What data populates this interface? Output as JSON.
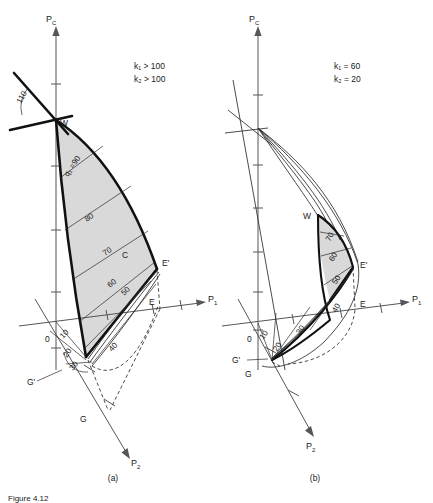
{
  "figure": {
    "caption_partial": "Figure 4.12",
    "panels": [
      {
        "id": "a",
        "panel_label": "(a)",
        "conditions": [
          "k₁ > 100",
          "k₂ > 100"
        ],
        "axes": {
          "vertical": "P",
          "vertical_sub": "C",
          "horizontal": "P",
          "horizontal_sub": "1",
          "depth": "P",
          "depth_sub": "2"
        },
        "origin_label": "0",
        "points": [
          {
            "name": "W",
            "label": "W"
          },
          {
            "name": "E-prime",
            "label": "E'"
          },
          {
            "name": "E",
            "label": "E"
          },
          {
            "name": "G-prime",
            "label": "G'"
          },
          {
            "name": "G",
            "label": "G"
          },
          {
            "name": "C",
            "label": "C"
          }
        ],
        "angle_label": "110",
        "contours": [
          "q₁ =90",
          "80",
          "70",
          "60",
          "50",
          "40",
          "30",
          "20",
          "10"
        ]
      },
      {
        "id": "b",
        "panel_label": "(b)",
        "conditions": [
          "k₁ = 60",
          "k₂ = 20"
        ],
        "axes": {
          "vertical": "P",
          "vertical_sub": "C",
          "horizontal": "P",
          "horizontal_sub": "1",
          "depth": "P",
          "depth_sub": "2"
        },
        "origin_label": "0",
        "points": [
          {
            "name": "W",
            "label": "W"
          },
          {
            "name": "E-prime",
            "label": "E'"
          },
          {
            "name": "E",
            "label": "E"
          },
          {
            "name": "G-prime",
            "label": "G'"
          },
          {
            "name": "G",
            "label": "G"
          }
        ],
        "contours": [
          "70",
          "60",
          "50",
          "40",
          "30",
          "20",
          "10"
        ]
      }
    ],
    "colors": {
      "shade": "#d9d9d9",
      "curve": "#111111",
      "axis": "#55555a",
      "text": "#1a1a1a"
    }
  }
}
